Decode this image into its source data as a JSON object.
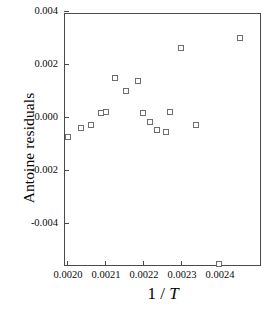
{
  "chart_data": {
    "type": "scatter",
    "title": "",
    "xlabel": "1 / T",
    "xlabel_parts": {
      "prefix": "1 / ",
      "italic": "T"
    },
    "ylabel": "Antoine residuals",
    "xlim": [
      0.00197,
      0.002452
    ],
    "ylim": [
      -0.005607,
      0.004
    ],
    "xticks": [
      0.002,
      0.0021,
      0.0022,
      0.0023,
      0.0024
    ],
    "xticklabels": [
      "0.0020",
      "0.0021",
      "0.0022",
      "0.0023",
      "0.0024"
    ],
    "yticks": [
      0.004,
      0.002,
      0.0,
      -0.002,
      -0.004
    ],
    "yticklabels": [
      "0.004",
      "0.002",
      "0.000",
      "-0.002",
      "-0.004"
    ],
    "grid": false,
    "legend": null,
    "marker": "open-square",
    "marker_color": "#6d6d72",
    "series": [
      {
        "name": "Antoine residuals",
        "points": [
          {
            "x": 0.002,
            "y": -0.00072
          },
          {
            "x": 0.002034,
            "y": -0.00038
          },
          {
            "x": 0.002061,
            "y": -0.00026
          },
          {
            "x": 0.002087,
            "y": 0.00019
          },
          {
            "x": 0.0021,
            "y": 0.00023
          },
          {
            "x": 0.002124,
            "y": 0.00151
          },
          {
            "x": 0.002153,
            "y": 0.00102
          },
          {
            "x": 0.002184,
            "y": 0.0014
          },
          {
            "x": 0.002197,
            "y": 0.00019
          },
          {
            "x": 0.002216,
            "y": -0.00015
          },
          {
            "x": 0.002234,
            "y": -0.00045
          },
          {
            "x": 0.002258,
            "y": -0.00053
          },
          {
            "x": 0.002268,
            "y": 0.00023
          },
          {
            "x": 0.002297,
            "y": 0.00264
          },
          {
            "x": 0.002337,
            "y": -0.00026
          },
          {
            "x": 0.002397,
            "y": -0.00551
          },
          {
            "x": 0.002452,
            "y": 0.00302
          }
        ]
      }
    ]
  }
}
